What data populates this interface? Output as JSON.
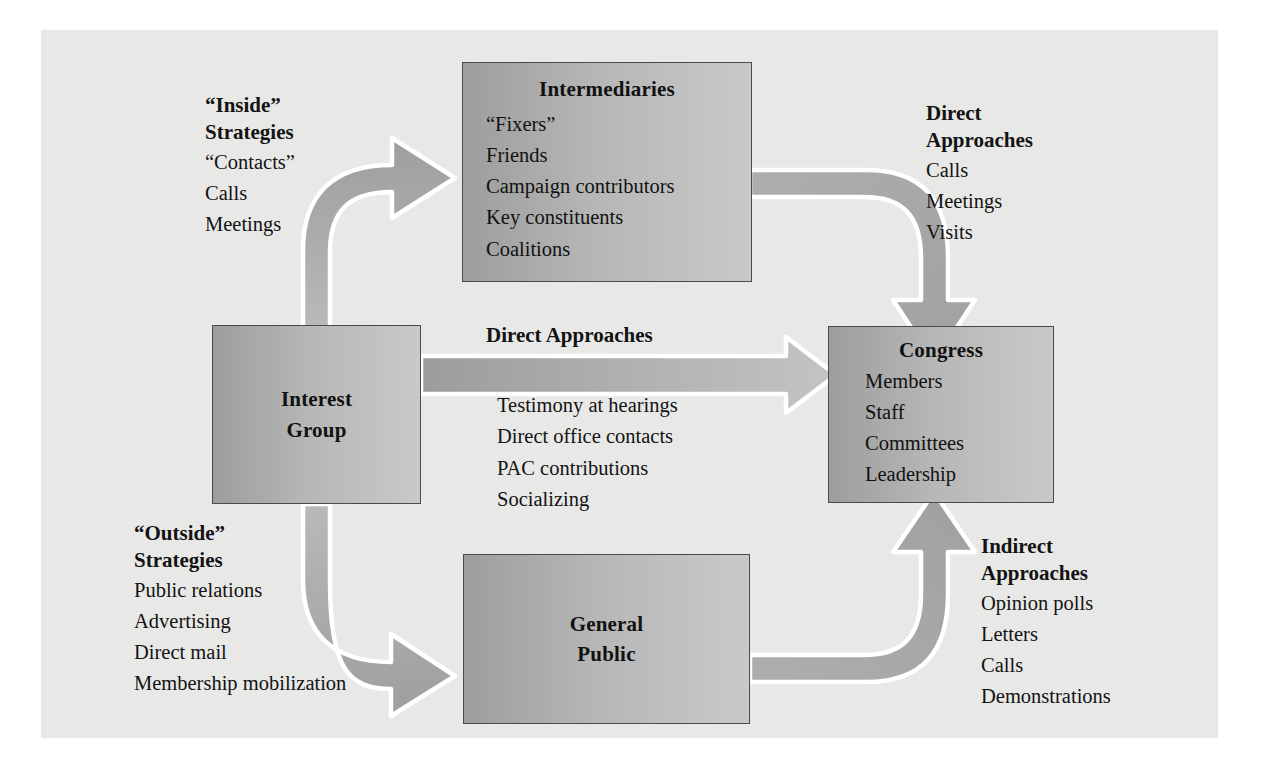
{
  "diagram": {
    "background_color": "#e8e8e7",
    "box_fill_dark": "#9d9d9d",
    "box_fill_light": "#c9c9c9",
    "arrow_fill": "#a9a9a9",
    "arrow_outline": "#ffffff"
  },
  "nodes": {
    "interest_group": {
      "title_line1": "Interest",
      "title_line2": "Group"
    },
    "intermediaries": {
      "title": "Intermediaries",
      "items": [
        "“Fixers”",
        "Friends",
        "Campaign contributors",
        "Key constituents",
        "Coalitions"
      ]
    },
    "congress": {
      "title": "Congress",
      "items": [
        "Members",
        "Staff",
        "Committees",
        "Leadership"
      ]
    },
    "general_public": {
      "title_line1": "General",
      "title_line2": "Public"
    }
  },
  "labels": {
    "inside_strategies": {
      "head_line1": "“Inside”",
      "head_line2": "Strategies",
      "items": [
        "“Contacts”",
        "Calls",
        "Meetings"
      ]
    },
    "outside_strategies": {
      "head_line1": "“Outside”",
      "head_line2": "Strategies",
      "items": [
        "Public relations",
        "Advertising",
        "Direct mail",
        "Membership mobilization"
      ]
    },
    "direct_approaches_right": {
      "head_line1": "Direct",
      "head_line2": "Approaches",
      "items": [
        "Calls",
        "Meetings",
        "Visits"
      ]
    },
    "indirect_approaches": {
      "head_line1": "Indirect",
      "head_line2": "Approaches",
      "items": [
        "Opinion polls",
        "Letters",
        "Calls",
        "Demonstrations"
      ]
    },
    "direct_approaches_center": {
      "head": "Direct Approaches",
      "items": [
        "Testimony at hearings",
        "Direct office contacts",
        "PAC contributions",
        "Socializing"
      ]
    }
  }
}
